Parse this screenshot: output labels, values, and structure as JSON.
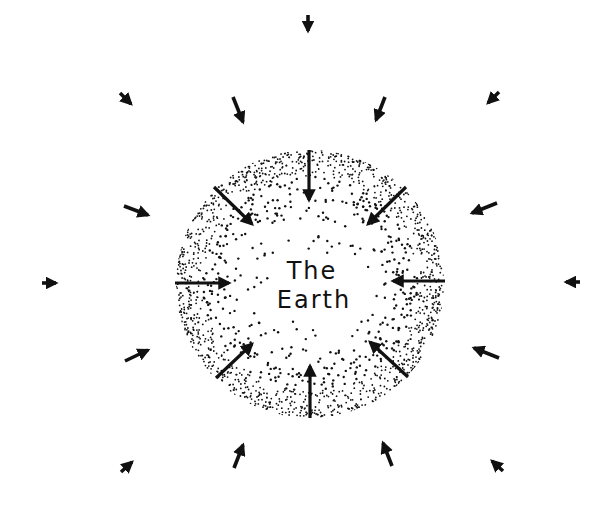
{
  "diagram": {
    "title_line1": "The",
    "title_line2": "Earth",
    "ink_color": "#111111",
    "background_color": "#ffffff",
    "earth": {
      "center": [
        310,
        284
      ],
      "radius": 134,
      "fill_style": "stippled-dots-denser-at-edge"
    },
    "surface_arrows_description": "8 large arrows on the Earth's surface pointing toward the center",
    "field_arrows_description": "16 small arrows outside the Earth pointing inward toward the center, representing the gravitational field"
  }
}
